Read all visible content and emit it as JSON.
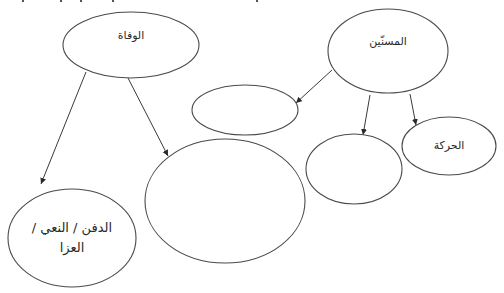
{
  "diagram": {
    "type": "concept-map",
    "direction": "rtl",
    "colors": {
      "stroke": "#4a4a4a",
      "fill": "#ffffff",
      "text": "#2a2a2a"
    },
    "nodes": [
      {
        "id": "death",
        "label": "الوفاة",
        "cx": 131,
        "cy": 45,
        "rx": 68,
        "ry": 33
      },
      {
        "id": "elderly",
        "label": "المسنّين",
        "cx": 388,
        "cy": 51,
        "rx": 60,
        "ry": 42
      },
      {
        "id": "blank-1",
        "label": "",
        "cx": 245,
        "cy": 110,
        "rx": 53,
        "ry": 25
      },
      {
        "id": "blank-2",
        "label": "",
        "cx": 225,
        "cy": 201,
        "rx": 80,
        "ry": 62
      },
      {
        "id": "blank-3",
        "label": "",
        "cx": 354,
        "cy": 169,
        "rx": 48,
        "ry": 35
      },
      {
        "id": "movement",
        "label": "الحركة",
        "cx": 449,
        "cy": 146,
        "rx": 47,
        "ry": 29
      },
      {
        "id": "burial",
        "label": "الدفن / النعي /\nالعزا",
        "cx": 72,
        "cy": 238,
        "rx": 64,
        "ry": 49
      }
    ],
    "edges": [
      {
        "from": "death",
        "to": "burial",
        "x1": 86,
        "y1": 72,
        "x2": 41,
        "y2": 184
      },
      {
        "from": "death",
        "to": "blank-2",
        "x1": 128,
        "y1": 78,
        "x2": 168,
        "y2": 156
      },
      {
        "from": "elderly",
        "to": "blank-1",
        "x1": 332,
        "y1": 70,
        "x2": 296,
        "y2": 103
      },
      {
        "from": "elderly",
        "to": "blank-3",
        "x1": 370,
        "y1": 95,
        "x2": 363,
        "y2": 135
      },
      {
        "from": "elderly",
        "to": "movement",
        "x1": 410,
        "y1": 94,
        "x2": 416,
        "y2": 125
      }
    ]
  }
}
